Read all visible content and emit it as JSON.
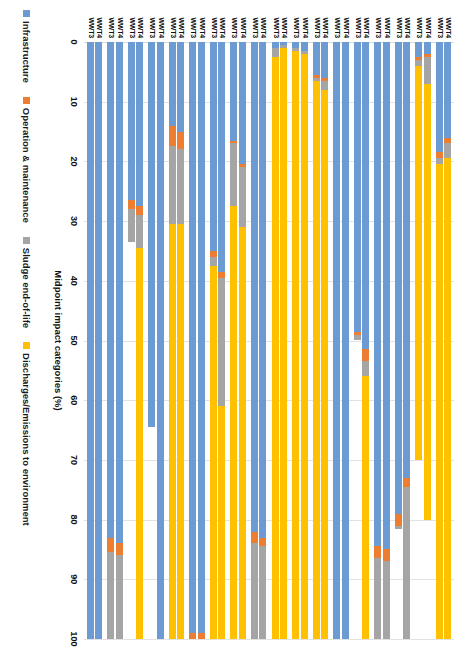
{
  "legend": {
    "items": [
      {
        "label": "Infrastructure",
        "color": "#6b9bd2",
        "icon": "square-swatch"
      },
      {
        "label": "Operation & maintenance",
        "color": "#ed7d31",
        "icon": "square-swatch"
      },
      {
        "label": "Sludge end-of-life",
        "color": "#a5a5a5",
        "icon": "square-swatch"
      },
      {
        "label": "Discharges/Emissions to environment",
        "color": "#ffc000",
        "icon": "square-swatch"
      }
    ]
  },
  "axis": {
    "title": "Midpoint impact categories (%)",
    "ticks": [
      "0",
      "10",
      "20",
      "30",
      "40",
      "50",
      "60",
      "70",
      "80",
      "90",
      "100"
    ],
    "min": 0,
    "max": 100
  },
  "series_labels": [
    "WWT4",
    "WWT3"
  ],
  "chart_data": {
    "type": "bar",
    "orientation": "horizontal-stacked-rotated",
    "title": "",
    "xlabel": "Midpoint impact categories (%)",
    "ylabel": "",
    "xlim": [
      0,
      100
    ],
    "grid": true,
    "legend_position": "top",
    "stack_order": [
      "Infrastructure",
      "Operation & maintenance",
      "Sludge end-of-life",
      "Discharges/Emissions to environment"
    ],
    "stack_colors": [
      "#6b9bd2",
      "#ed7d31",
      "#a5a5a5",
      "#ffc000"
    ],
    "categories": [
      "Global warming",
      "Ozone depletion",
      "Ionizing radiation",
      "Ozone formation. Human health",
      "Fine particulate matter formation",
      "Ozone formation. Terrestrial ecosystems",
      "Terrestrial acidification",
      "Freshwater eutrophication",
      "Marine eutrophication",
      "Terrestrial ecotoxicity",
      "Freshwater ecotoxicity",
      "Marine ecotoxicity",
      "Human carcinogenic toxicity",
      "Human non-carcinogenic toxicity",
      "Land use",
      "Mineral resource scarcity",
      "Fossil resource scarcity",
      "Water consumption"
    ],
    "series": [
      {
        "name": "WWT4",
        "stacks": [
          [
            16.0,
            1.0,
            2.5,
            80.5
          ],
          [
            2.0,
            0.5,
            4.5,
            73.0
          ],
          [
            73.0,
            1.5,
            25.5,
            0.0
          ],
          [
            85.0,
            2.0,
            13.0,
            0.0
          ],
          [
            51.5,
            2.0,
            2.5,
            44.0
          ],
          [
            100.0,
            0.0,
            0.0,
            0.0
          ],
          [
            6.0,
            0.5,
            1.5,
            92.0
          ],
          [
            1.5,
            0.0,
            0.5,
            98.0
          ],
          [
            0.5,
            0.0,
            0.5,
            99.0
          ],
          [
            83.0,
            1.5,
            15.5,
            0.0
          ],
          [
            20.5,
            0.5,
            10.0,
            69.0
          ],
          [
            38.5,
            1.0,
            21.5,
            39.0
          ],
          [
            99.0,
            1.0,
            0.0,
            0.0
          ],
          [
            15.0,
            3.0,
            12.5,
            69.5
          ],
          [
            100.0,
            0.0,
            0.0,
            0.0
          ],
          [
            27.5,
            1.5,
            5.5,
            65.5
          ],
          [
            84.0,
            2.0,
            14.0,
            0.0
          ],
          [
            100.0,
            0.0,
            0.0,
            0.0
          ]
        ]
      },
      {
        "name": "WWT3",
        "stacks": [
          [
            18.5,
            1.0,
            1.0,
            79.5
          ],
          [
            2.5,
            0.5,
            1.0,
            66.0
          ],
          [
            79.0,
            2.0,
            0.5,
            0.0
          ],
          [
            84.5,
            2.0,
            13.5,
            0.0
          ],
          [
            48.5,
            0.5,
            1.0,
            0.0
          ],
          [
            100.0,
            0.0,
            0.0,
            0.0
          ],
          [
            5.5,
            0.5,
            0.5,
            93.5
          ],
          [
            1.0,
            0.0,
            0.5,
            98.5
          ],
          [
            1.0,
            0.0,
            1.5,
            97.5
          ],
          [
            82.0,
            2.0,
            16.0,
            0.0
          ],
          [
            16.5,
            0.5,
            10.5,
            72.5
          ],
          [
            35.0,
            1.0,
            1.5,
            62.5
          ],
          [
            99.0,
            1.0,
            0.0,
            0.0
          ],
          [
            14.0,
            3.5,
            13.0,
            69.5
          ],
          [
            64.5,
            0.0,
            0.0,
            0.0
          ],
          [
            26.5,
            1.5,
            5.5,
            0.0
          ],
          [
            83.0,
            2.5,
            14.5,
            0.0
          ],
          [
            100.0,
            0.0,
            0.0,
            0.0
          ]
        ]
      }
    ]
  }
}
